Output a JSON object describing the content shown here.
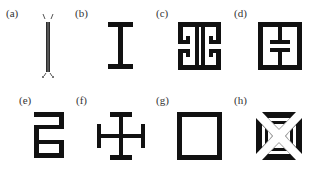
{
  "figure": {
    "panels": [
      {
        "id": "a",
        "label": "(a)",
        "shape": "thin-vertical-bar-with-end-ticks"
      },
      {
        "id": "b",
        "label": "(b)",
        "shape": "i-beam"
      },
      {
        "id": "c",
        "label": "(c)",
        "shape": "square-with-mirrored-hooks"
      },
      {
        "id": "d",
        "label": "(d)",
        "shape": "square-with-split-center-stem"
      },
      {
        "id": "e",
        "label": "(e)",
        "shape": "serpentine-meander"
      },
      {
        "id": "f",
        "label": "(f)",
        "shape": "cross-with-t-ends"
      },
      {
        "id": "g",
        "label": "(g)",
        "shape": "square-ring"
      },
      {
        "id": "h",
        "label": "(h)",
        "shape": "square-with-diagonal-cutouts"
      }
    ],
    "colors": {
      "stroke": "#111111",
      "label": "#333333",
      "background": "#ffffff"
    }
  }
}
